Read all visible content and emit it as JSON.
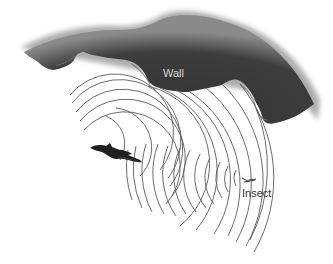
{
  "diagram": {
    "labels": {
      "wall": "Wall",
      "insect": "Insect"
    },
    "elements": [
      {
        "id": "wall",
        "type": "rock-wall",
        "color": "#3a3a3a"
      },
      {
        "id": "bat",
        "type": "bat-silhouette",
        "color": "#1e1e1e"
      },
      {
        "id": "insect",
        "type": "insect-glyph",
        "color": "#333333"
      },
      {
        "id": "outgoing-waves",
        "type": "concentric-arcs",
        "color": "#555555"
      },
      {
        "id": "reflected-waves",
        "type": "concentric-arcs",
        "color": "#555555"
      }
    ]
  }
}
